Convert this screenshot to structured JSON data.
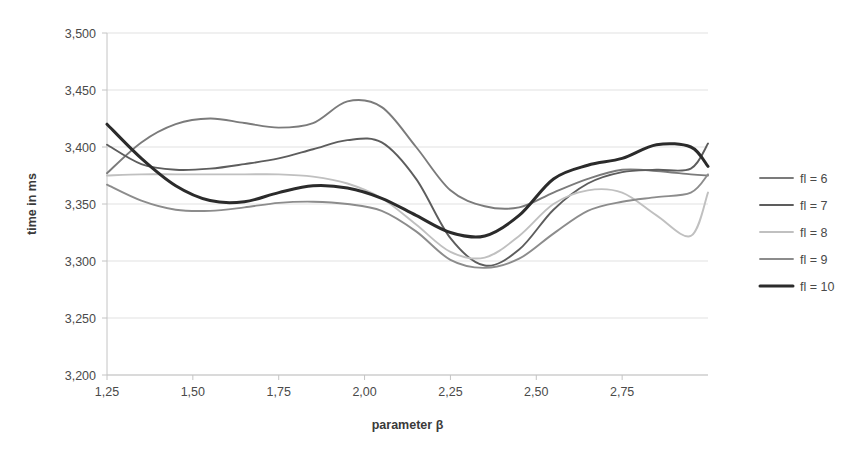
{
  "chart_data": {
    "type": "line",
    "title": "",
    "xlabel": "parameter β",
    "ylabel": "time in ms",
    "xlim": [
      1.25,
      3.0
    ],
    "ylim": [
      3200,
      3500
    ],
    "ytick_labels": [
      "3,500",
      "3,450",
      "3,400",
      "3,350",
      "3,300",
      "3,250",
      "3,200"
    ],
    "ytick_values": [
      3500,
      3450,
      3400,
      3350,
      3300,
      3250,
      3200
    ],
    "xtick_labels": [
      "1,25",
      "1,50",
      "1,75",
      "2,00",
      "2,25",
      "2,50",
      "2,75"
    ],
    "xtick_values": [
      1.25,
      1.5,
      1.75,
      2.0,
      2.25,
      2.5,
      2.75
    ],
    "grid": "horizontal",
    "legend_position": "right",
    "x": [
      1.25,
      1.35,
      1.45,
      1.55,
      1.65,
      1.75,
      1.85,
      1.95,
      2.05,
      2.15,
      2.25,
      2.35,
      2.45,
      2.55,
      2.65,
      2.75,
      2.85,
      2.95,
      3.0
    ],
    "series": [
      {
        "name": "fl = 6",
        "color": "#7b7b7b",
        "width": 1.9,
        "values": [
          3377,
          3404,
          3420,
          3425,
          3421,
          3417,
          3421,
          3440,
          3435,
          3400,
          3362,
          3348,
          3347,
          3360,
          3372,
          3380,
          3379,
          3376,
          3375
        ]
      },
      {
        "name": "fl = 7",
        "color": "#5d5d5d",
        "width": 1.9,
        "values": [
          3402,
          3385,
          3380,
          3381,
          3385,
          3390,
          3398,
          3406,
          3404,
          3372,
          3320,
          3296,
          3310,
          3345,
          3368,
          3378,
          3380,
          3381,
          3403
        ]
      },
      {
        "name": "fl = 8",
        "color": "#c0c0c0",
        "width": 1.9,
        "values": [
          3375,
          3376,
          3376,
          3376,
          3376,
          3376,
          3374,
          3368,
          3355,
          3332,
          3308,
          3303,
          3322,
          3350,
          3362,
          3360,
          3340,
          3322,
          3360
        ]
      },
      {
        "name": "fl = 9",
        "color": "#8c8c8c",
        "width": 1.9,
        "values": [
          3367,
          3353,
          3345,
          3344,
          3347,
          3351,
          3352,
          3350,
          3344,
          3326,
          3301,
          3294,
          3302,
          3324,
          3344,
          3352,
          3356,
          3360,
          3376
        ]
      },
      {
        "name": "fl = 10",
        "color": "#2b2b2b",
        "width": 3.0,
        "values": [
          3420,
          3390,
          3366,
          3353,
          3352,
          3360,
          3366,
          3364,
          3355,
          3340,
          3325,
          3322,
          3340,
          3372,
          3384,
          3390,
          3402,
          3400,
          3383
        ]
      }
    ]
  },
  "legend": {
    "items": [
      {
        "label": "fl = 6"
      },
      {
        "label": "fl = 7"
      },
      {
        "label": "fl = 8"
      },
      {
        "label": "fl = 9"
      },
      {
        "label": "fl = 10"
      }
    ]
  }
}
